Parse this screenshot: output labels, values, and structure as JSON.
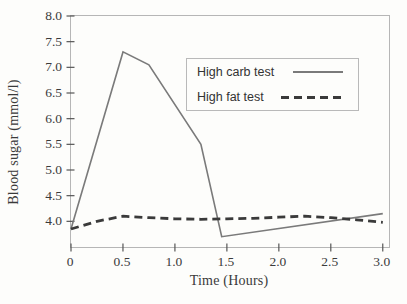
{
  "chart_data": {
    "type": "line",
    "title": "",
    "xlabel": "Time (Hours)",
    "ylabel": "Blood sugar (mmol/l)",
    "xlim": [
      0,
      3.06
    ],
    "ylim": [
      3.5,
      8.0
    ],
    "x_ticks": [
      0,
      0.5,
      1.0,
      1.5,
      2.0,
      2.5,
      3.0
    ],
    "x_tick_labels": [
      "0",
      "0.5",
      "1.0",
      "1.5",
      "2.0",
      "2.5",
      "3.0"
    ],
    "y_ticks": [
      4.0,
      4.5,
      5.0,
      5.5,
      6.0,
      6.5,
      7.0,
      7.5,
      8.0
    ],
    "y_tick_labels": [
      "4.0",
      "4.5",
      "5.0",
      "5.5",
      "6.0",
      "6.5",
      "7.0",
      "7.5",
      "8.0"
    ],
    "grid": false,
    "legend_position": "upper-right-inside",
    "series": [
      {
        "name": "High carb test",
        "style": "solid",
        "color": "#7a7a7a",
        "line_width": 1.6,
        "points": [
          [
            0,
            3.85
          ],
          [
            0.5,
            7.3
          ],
          [
            0.75,
            7.05
          ],
          [
            1.25,
            5.5
          ],
          [
            1.45,
            3.7
          ],
          [
            3.0,
            4.15
          ]
        ]
      },
      {
        "name": "High fat test",
        "style": "dashed",
        "color": "#3a3a3a",
        "line_width": 2.8,
        "points": [
          [
            0,
            3.85
          ],
          [
            0.25,
            4.0
          ],
          [
            0.5,
            4.1
          ],
          [
            0.75,
            4.07
          ],
          [
            1.0,
            4.05
          ],
          [
            1.25,
            4.04
          ],
          [
            1.5,
            4.05
          ],
          [
            1.75,
            4.06
          ],
          [
            2.0,
            4.08
          ],
          [
            2.25,
            4.1
          ],
          [
            2.5,
            4.07
          ],
          [
            2.75,
            4.03
          ],
          [
            3.0,
            3.98
          ]
        ]
      }
    ],
    "colors": {
      "axis_border": "#b6b6b6",
      "tick": "#555555",
      "text": "#3a3a3a",
      "background": "#fdfdfb"
    }
  }
}
